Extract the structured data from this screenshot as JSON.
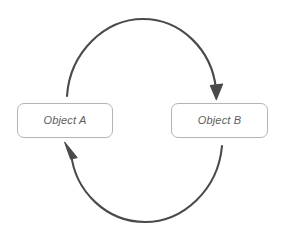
{
  "diagram": {
    "type": "cycle",
    "canvas": {
      "width": 290,
      "height": 242,
      "background": "#ffffff"
    },
    "stroke_color": "#4a4a4a",
    "box_border_color": "#b4b4b4",
    "label_color": "#5d5d5d",
    "nodes": [
      {
        "id": "object-a",
        "label": "Object A",
        "shape": "rounded-rectangle",
        "x": 17,
        "y": 103,
        "width": 96,
        "height": 35
      },
      {
        "id": "object-b",
        "label": "Object B",
        "shape": "rounded-rectangle",
        "x": 171,
        "y": 103,
        "width": 97,
        "height": 35
      }
    ],
    "connectors": [
      {
        "id": "arc-a-to-b",
        "from": "object-a",
        "to": "object-b",
        "direction": "clockwise",
        "position": "top",
        "arrowhead": "end",
        "label": ""
      },
      {
        "id": "arc-b-to-a",
        "from": "object-b",
        "to": "object-a",
        "direction": "clockwise",
        "position": "bottom",
        "arrowhead": "end",
        "label": ""
      }
    ]
  }
}
